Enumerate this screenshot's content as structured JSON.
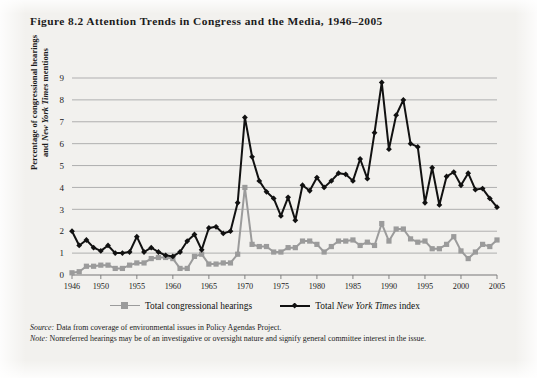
{
  "figure": {
    "title_prefix": "Figure 8.2",
    "title_main": "Attention Trends in Congress and the Media, 1946–2005",
    "title_full": "Figure 8.2 Attention Trends in Congress and the Media, 1946–2005",
    "ylabel_line1": "Percentage of congressional hearings",
    "ylabel_line2_pre": "and ",
    "ylabel_line2_ital": "New York Times",
    "ylabel_line2_post": " mentions",
    "source_label": "Source:",
    "source_text": " Data from coverage of environmental issues in Policy Agendas Project.",
    "note_label": "Note:",
    "note_text": " Nonreferred hearings may be of an investigative or oversight nature and signify general committee interest in the issue.",
    "colors": {
      "background": "#f2f1ee",
      "series_gray": "#9b9b9b",
      "series_black": "#111111",
      "gridline": "#a8a8a8",
      "text": "#1b1b1b"
    }
  },
  "chart_data": {
    "type": "line",
    "title": "Attention Trends in Congress and the Media, 1946–2005",
    "xlabel": "",
    "ylabel": "Percentage of congressional hearings and New York Times mentions",
    "ylim": [
      0,
      9
    ],
    "yticks": [
      0,
      1,
      2,
      3,
      4,
      5,
      6,
      7,
      8,
      9
    ],
    "ytick_labels": [
      "0",
      "1",
      "2",
      "3",
      "4",
      "5",
      "6",
      "7",
      "8",
      "9"
    ],
    "xlim": [
      1946,
      2005
    ],
    "xticks": [
      1946,
      1950,
      1955,
      1960,
      1965,
      1970,
      1975,
      1980,
      1985,
      1990,
      1995,
      2000,
      2005
    ],
    "xtick_labels": [
      "1946",
      "1950",
      "1955",
      "1960",
      "1965",
      "1970",
      "1975",
      "1980",
      "1985",
      "1990",
      "1995",
      "2000",
      "2005"
    ],
    "grid": "horizontal",
    "legend_position": "below-axis",
    "x": [
      1946,
      1947,
      1948,
      1949,
      1950,
      1951,
      1952,
      1953,
      1954,
      1955,
      1956,
      1957,
      1958,
      1959,
      1960,
      1961,
      1962,
      1963,
      1964,
      1965,
      1966,
      1967,
      1968,
      1969,
      1970,
      1971,
      1972,
      1973,
      1974,
      1975,
      1976,
      1977,
      1978,
      1979,
      1980,
      1981,
      1982,
      1983,
      1984,
      1985,
      1986,
      1987,
      1988,
      1989,
      1990,
      1991,
      1992,
      1993,
      1994,
      1995,
      1996,
      1997,
      1998,
      1999,
      2000,
      2001,
      2002,
      2003,
      2004,
      2005
    ],
    "series": [
      {
        "name": "Total congressional hearings",
        "color": "#9b9b9b",
        "marker": "square",
        "values": [
          0.1,
          0.15,
          0.4,
          0.4,
          0.45,
          0.45,
          0.3,
          0.3,
          0.45,
          0.55,
          0.55,
          0.75,
          0.8,
          0.8,
          0.75,
          0.3,
          0.3,
          0.85,
          0.95,
          0.5,
          0.5,
          0.55,
          0.55,
          0.95,
          4.0,
          1.4,
          1.3,
          1.3,
          1.05,
          1.05,
          1.25,
          1.25,
          1.55,
          1.55,
          1.4,
          1.05,
          1.3,
          1.55,
          1.55,
          1.6,
          1.35,
          1.5,
          1.35,
          2.35,
          1.55,
          2.1,
          2.1,
          1.65,
          1.5,
          1.55,
          1.2,
          1.2,
          1.4,
          1.75,
          1.1,
          0.75,
          1.05,
          1.4,
          1.3,
          1.6
        ]
      },
      {
        "name": "Total New York Times index",
        "color": "#111111",
        "marker": "diamond",
        "values": [
          2.0,
          1.35,
          1.6,
          1.25,
          1.1,
          1.35,
          1.0,
          1.0,
          1.05,
          1.75,
          1.05,
          1.25,
          1.05,
          0.9,
          0.85,
          1.05,
          1.55,
          1.85,
          1.15,
          2.15,
          2.2,
          1.9,
          2.0,
          3.3,
          7.2,
          5.4,
          4.3,
          3.8,
          3.5,
          2.7,
          3.55,
          2.5,
          4.1,
          3.85,
          4.45,
          4.0,
          4.3,
          4.65,
          4.6,
          4.3,
          5.3,
          4.4,
          6.5,
          8.8,
          5.75,
          7.3,
          8.0,
          6.0,
          5.85,
          3.3,
          4.9,
          3.2,
          4.5,
          4.7,
          4.1,
          4.65,
          3.9,
          3.95,
          3.5,
          3.1
        ]
      }
    ]
  }
}
